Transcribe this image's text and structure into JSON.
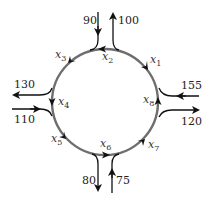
{
  "diagram": {
    "type": "traffic-roundabout-network",
    "direction": "counter-clockwise",
    "colors": {
      "ring": "#666666",
      "roads": "#222222",
      "text": "#222222"
    },
    "segments": [
      {
        "name": "x1",
        "base": "x",
        "sub": "1"
      },
      {
        "name": "x2",
        "base": "x",
        "sub": "2"
      },
      {
        "name": "x3",
        "base": "x",
        "sub": "3"
      },
      {
        "name": "x4",
        "base": "x",
        "sub": "4"
      },
      {
        "name": "x5",
        "base": "x",
        "sub": "5"
      },
      {
        "name": "x6",
        "base": "x",
        "sub": "6"
      },
      {
        "name": "x7",
        "base": "x",
        "sub": "7"
      },
      {
        "name": "x8",
        "base": "x",
        "sub": "8"
      }
    ],
    "external_flows": [
      {
        "label": "90",
        "direction": "in",
        "position": "top-left"
      },
      {
        "label": "100",
        "direction": "out",
        "position": "top-right"
      },
      {
        "label": "130",
        "direction": "out",
        "position": "left-upper"
      },
      {
        "label": "110",
        "direction": "in",
        "position": "left-lower"
      },
      {
        "label": "80",
        "direction": "out",
        "position": "bottom-left"
      },
      {
        "label": "75",
        "direction": "in",
        "position": "bottom-right"
      },
      {
        "label": "155",
        "direction": "in",
        "position": "right-upper"
      },
      {
        "label": "120",
        "direction": "out",
        "position": "right-lower"
      }
    ]
  }
}
